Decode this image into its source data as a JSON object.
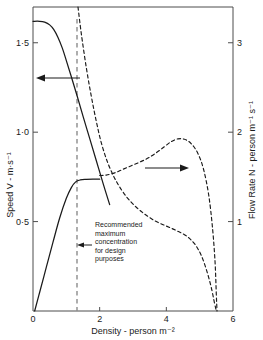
{
  "chart_data": {
    "type": "line",
    "title": "",
    "xlabel": "Density - person  m⁻²",
    "ylabel": "Speed  V - m·s⁻¹",
    "y2label": "Flow Rate  N - person  m⁻¹ s⁻¹",
    "xlim": [
      0,
      6
    ],
    "ylim": [
      0,
      1.7
    ],
    "y2lim": [
      0,
      3.4
    ],
    "xticks": [
      0,
      2,
      4,
      6
    ],
    "xticklabels": [
      "0",
      "2",
      "4",
      "6"
    ],
    "yticks": [
      0.5,
      1.0,
      1.5
    ],
    "yticklabels": [
      "0·5",
      "1·0",
      "1·5"
    ],
    "y2ticks": [
      1,
      2,
      3
    ],
    "y2ticklabels": [
      "1",
      "2",
      "3"
    ],
    "grid": false,
    "legend_position": "none",
    "series": [
      {
        "name": "Speed upper branch",
        "axis": "left",
        "style": "solid",
        "points": [
          [
            0.0,
            1.62
          ],
          [
            0.2,
            1.62
          ],
          [
            0.35,
            1.615
          ],
          [
            0.5,
            1.6
          ],
          [
            0.62,
            1.575
          ],
          [
            0.75,
            1.53
          ],
          [
            0.88,
            1.47
          ],
          [
            1.0,
            1.4
          ],
          [
            1.15,
            1.31
          ],
          [
            1.32,
            1.205
          ],
          [
            1.5,
            1.09
          ],
          [
            1.7,
            0.965
          ],
          [
            1.9,
            0.84
          ],
          [
            2.1,
            0.715
          ],
          [
            2.3,
            0.595
          ]
        ]
      },
      {
        "name": "Speed lower branch",
        "axis": "left",
        "style": "solid",
        "points": [
          [
            0.05,
            0.0
          ],
          [
            0.2,
            0.105
          ],
          [
            0.4,
            0.245
          ],
          [
            0.6,
            0.385
          ],
          [
            0.8,
            0.52
          ],
          [
            1.0,
            0.63
          ],
          [
            1.15,
            0.69
          ],
          [
            1.28,
            0.722
          ],
          [
            1.42,
            0.733
          ],
          [
            1.6,
            0.736
          ],
          [
            1.8,
            0.737
          ],
          [
            2.0,
            0.737
          ]
        ]
      },
      {
        "name": "Flow rate falling branch",
        "axis": "right",
        "style": "dashed",
        "points": [
          [
            1.35,
            3.4
          ],
          [
            1.45,
            3.1
          ],
          [
            1.6,
            2.72
          ],
          [
            1.75,
            2.4
          ],
          [
            1.9,
            2.12
          ],
          [
            2.05,
            1.88
          ],
          [
            2.25,
            1.65
          ],
          [
            2.5,
            1.45
          ],
          [
            2.8,
            1.28
          ],
          [
            3.1,
            1.16
          ],
          [
            3.4,
            1.07
          ],
          [
            3.7,
            1.0
          ],
          [
            4.0,
            0.95
          ],
          [
            4.3,
            0.9
          ],
          [
            4.6,
            0.84
          ],
          [
            4.85,
            0.75
          ],
          [
            5.05,
            0.62
          ],
          [
            5.22,
            0.44
          ],
          [
            5.35,
            0.26
          ],
          [
            5.45,
            0.08
          ],
          [
            5.5,
            0.0
          ]
        ]
      },
      {
        "name": "Flow rate rising branch",
        "axis": "right",
        "style": "dashed",
        "points": [
          [
            2.0,
            1.515
          ],
          [
            2.2,
            1.52
          ],
          [
            2.45,
            1.545
          ],
          [
            2.7,
            1.585
          ],
          [
            2.95,
            1.625
          ],
          [
            3.2,
            1.665
          ],
          [
            3.45,
            1.71
          ],
          [
            3.7,
            1.77
          ],
          [
            3.95,
            1.84
          ],
          [
            4.15,
            1.895
          ],
          [
            4.35,
            1.925
          ],
          [
            4.55,
            1.92
          ],
          [
            4.75,
            1.87
          ],
          [
            4.95,
            1.76
          ],
          [
            5.12,
            1.58
          ],
          [
            5.27,
            1.3
          ],
          [
            5.38,
            0.95
          ],
          [
            5.46,
            0.56
          ],
          [
            5.5,
            0.18
          ],
          [
            5.52,
            0.0
          ]
        ]
      }
    ],
    "annotations": [
      {
        "name": "recommended-maximum-line",
        "type": "vline",
        "x": 1.32,
        "style": "dashed"
      },
      {
        "name": "recommended-maximum-note",
        "type": "text-with-arrow",
        "lines": [
          "Recommended",
          "maximum",
          "concentration",
          "for design",
          "purposes"
        ],
        "arrow_direction": "left"
      },
      {
        "name": "speed-axis-pointer",
        "type": "arrow",
        "direction": "left"
      },
      {
        "name": "flow-rate-axis-pointer",
        "type": "arrow",
        "direction": "right"
      }
    ],
    "colors": {
      "axis": "#4d4d4d",
      "curve": "#1a1a1a",
      "dashed_vline": "#8c8c8c",
      "text": "#1a1a1a",
      "background": "#ffffff"
    }
  }
}
